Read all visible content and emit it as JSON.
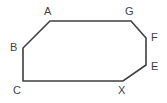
{
  "figure": {
    "kind": "polygon-diagram",
    "shape_name": "heptagon",
    "background_color": "#ffffff",
    "stroke_color": "#3f3f3f",
    "stroke_width": 1.6,
    "fill_color": "none",
    "width": 167,
    "height": 103,
    "vertices": [
      {
        "id": "A",
        "label": "A",
        "x": 50,
        "y": 21,
        "label_x": 44,
        "label_y": 6
      },
      {
        "id": "G",
        "label": "G",
        "x": 131,
        "y": 21,
        "label_x": 125,
        "label_y": 6
      },
      {
        "id": "F",
        "label": "F",
        "x": 146,
        "y": 38,
        "label_x": 151,
        "label_y": 32
      },
      {
        "id": "E",
        "label": "E",
        "x": 146,
        "y": 65,
        "label_x": 151,
        "label_y": 61
      },
      {
        "id": "X",
        "label": "X",
        "x": 123,
        "y": 81,
        "label_x": 118,
        "label_y": 85
      },
      {
        "id": "C",
        "label": "C",
        "x": 23,
        "y": 81,
        "label_x": 13,
        "label_y": 85
      },
      {
        "id": "B",
        "label": "B",
        "x": 23,
        "y": 48,
        "label_x": 10,
        "label_y": 42
      }
    ],
    "edges": [
      {
        "from": "A",
        "to": "G",
        "name": "edge-a-g"
      },
      {
        "from": "G",
        "to": "F",
        "name": "edge-g-f"
      },
      {
        "from": "F",
        "to": "E",
        "name": "edge-f-e"
      },
      {
        "from": "E",
        "to": "X",
        "name": "edge-e-x"
      },
      {
        "from": "X",
        "to": "C",
        "name": "edge-x-c"
      },
      {
        "from": "C",
        "to": "B",
        "name": "edge-c-b"
      },
      {
        "from": "B",
        "to": "A",
        "name": "edge-b-a"
      }
    ],
    "polygon_points": "50,21 131,21 146,38 146,65 123,81 23,81 23,48"
  }
}
